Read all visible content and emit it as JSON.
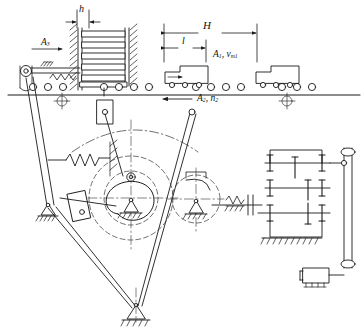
{
  "diagram": {
    "type": "mechanical-kinematic-diagram"
  },
  "labels": {
    "h": "h",
    "l": "l",
    "H": "H",
    "a1_base": "A",
    "a1_sub": "1",
    "a1_rest": ", v",
    "a1_vsub": "m1",
    "a2_base": "A",
    "a2_sub": "2",
    "a2_rest": ", n",
    "a2_nsub": "2",
    "a3_base": "A",
    "a3_sub": "3"
  },
  "colors": {
    "line": "#1a1a1a",
    "thin": "#2b2b2b",
    "center": "#333333",
    "paper": "#ffffff",
    "fill": "#ffffff"
  },
  "components": {
    "magazine": "stack-magazine-feeder",
    "conveyor": "roller-conveyor",
    "workpiece_left": "workpiece-box-left",
    "workpiece_right": "workpiece-box-right",
    "pusher": "spring-loaded-pusher",
    "rocker": "rocker-arm-linkage",
    "spring": "return-spring",
    "cam": "cam-disc",
    "follower": "slider-follower",
    "gearbox": "gear-train-reducer",
    "belt": "belt-drive",
    "motor": "electric-motor",
    "clutch": "shaft-clutch-coupling",
    "ground": "ground-support"
  },
  "geometry": {
    "dim_h": {
      "x1": 77,
      "x2": 88,
      "y": 16
    },
    "dim_l": {
      "x1": 163,
      "x2": 205,
      "y": 46
    },
    "dim_H": {
      "x1": 163,
      "x2": 255,
      "y": 30
    },
    "conveyor_line_y": 95,
    "roller_y": 86,
    "cam_center": {
      "x": 131,
      "y": 198
    },
    "pivot_bottom": {
      "x": 135,
      "y": 312
    },
    "pivot_left": {
      "x": 47,
      "y": 208
    }
  }
}
